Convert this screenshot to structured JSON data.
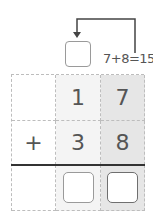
{
  "carry": {
    "equation": "7+8=15",
    "box_value": ""
  },
  "problem": {
    "operator": "+",
    "rows": [
      {
        "tens": "1",
        "ones": "7"
      },
      {
        "tens": "3",
        "ones": "8"
      }
    ],
    "answer": {
      "tens": "",
      "ones": ""
    }
  },
  "colors": {
    "arrow": "#444444",
    "text": "#555555",
    "ones_column_shade": "#e6e6e6",
    "tens_column_shade": "#f4f4f4"
  }
}
